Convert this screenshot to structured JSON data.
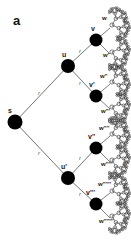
{
  "figure": {
    "panel_label": "a",
    "width": 131,
    "height": 245,
    "background_color": "#ffffff",
    "node_color": "#000000",
    "edge_color": "#3a3a3a",
    "label_color": "#1a1a1a"
  },
  "graph": {
    "type": "binary-tree-fractal",
    "description": "Recursive binary branching tree rooted at s, expanding rightward into a self-similar fractal of small open circles.",
    "root": {
      "id": "s",
      "label": "s",
      "x": 15,
      "y": 122
    },
    "level_1": [
      {
        "id": "u",
        "label": "u",
        "x": 68,
        "y": 66
      },
      {
        "id": "u_prime",
        "label": "u'",
        "x": 68,
        "y": 178
      }
    ],
    "level_2": [
      {
        "id": "v",
        "label": "v",
        "x": 96,
        "y": 40
      },
      {
        "id": "v_prime",
        "label": "v'",
        "x": 96,
        "y": 96
      },
      {
        "id": "v_prime2",
        "label": "v''",
        "x": 96,
        "y": 148
      },
      {
        "id": "v_prime3",
        "label": "v'''",
        "x": 96,
        "y": 204
      }
    ],
    "level_3": [
      {
        "id": "w1",
        "label": "w",
        "x": 112,
        "y": 25
      },
      {
        "id": "w2",
        "label": "w'",
        "x": 112,
        "y": 52
      },
      {
        "id": "w3",
        "label": "w''",
        "x": 112,
        "y": 82
      },
      {
        "id": "w4",
        "label": "w'''",
        "x": 112,
        "y": 107
      },
      {
        "id": "w5",
        "label": "w''''",
        "x": 112,
        "y": 134
      },
      {
        "id": "w6",
        "label": "w'''''",
        "x": 112,
        "y": 160
      },
      {
        "id": "w7",
        "label": "w''''''",
        "x": 112,
        "y": 191
      },
      {
        "id": "w8",
        "label": "w'''''''",
        "x": 112,
        "y": 216
      }
    ],
    "edge_labels": {
      "root_upper": "r",
      "root_lower": "r",
      "u_upper": "r",
      "u_lower": "r",
      "u_prime_upper": "r",
      "u_prime_lower": "r"
    }
  }
}
